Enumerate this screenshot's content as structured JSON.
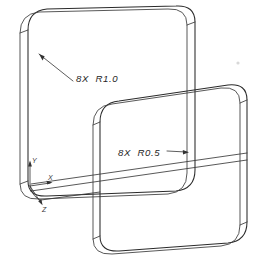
{
  "drawing": {
    "title": "Isometric view of two rounded rectangular plates",
    "background_color": "#ffffff",
    "line_color": "#2b2b2b",
    "text_color": "#262626",
    "callouts": [
      {
        "id": "radius-callout-1",
        "text": "8X  R1.0",
        "quantity": "8X",
        "radius": "R1.0",
        "target": "back-plate-inner-corner",
        "text_x": 76,
        "text_y": 79
      },
      {
        "id": "radius-callout-2",
        "text": "8X  R0.5",
        "quantity": "8X",
        "radius": "R0.5",
        "target": "front-plate-inner-corner",
        "text_x": 118,
        "text_y": 156
      }
    ],
    "axis_indicator": {
      "name": "coordinate-axis-triad",
      "origin_x": 30,
      "origin_y": 186,
      "axes": [
        {
          "label": "Y",
          "direction": "up",
          "label_x": 29,
          "label_y": 162
        },
        {
          "label": "X",
          "direction": "right",
          "label_x": 47,
          "label_y": 182
        },
        {
          "label": "Z",
          "direction": "down-forward",
          "label_x": 43,
          "label_y": 211
        }
      ]
    },
    "parts": [
      {
        "id": "back-plate",
        "label": "Back rounded rectangular plate",
        "corner_radius_callout": "R1.0"
      },
      {
        "id": "front-plate",
        "label": "Front rounded rectangular plate",
        "corner_radius_callout": "R0.5"
      }
    ]
  }
}
